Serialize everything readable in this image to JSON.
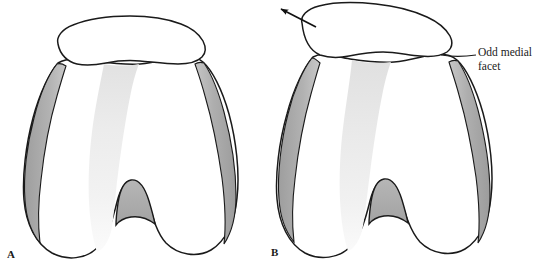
{
  "figure": {
    "type": "anatomical-illustration",
    "background_color": "#ffffff",
    "outline_color": "#1a1a1a",
    "shading": {
      "condyle_gray": "#a9a9a9",
      "condyle_gray_light": "#c4c4c4",
      "groove_gray": "#ededed",
      "notch_gray": "#b0b0b0"
    }
  },
  "panels": [
    {
      "id": "A",
      "letter": "A",
      "description": "Patella centered on femoral trochlea",
      "patella_position": "centered"
    },
    {
      "id": "B",
      "letter": "B",
      "description": "Patella displaced medially with arrow indicating direction of translation",
      "patella_position": "medially-displaced",
      "arrow": {
        "name": "medial-translation-arrow",
        "direction": "up-left"
      }
    }
  ],
  "annotations": [
    {
      "id": "odd-medial-facet",
      "text": "Odd medial\nfacet",
      "leader": "line from patellar-femoral junction to text",
      "panel": "B"
    }
  ]
}
